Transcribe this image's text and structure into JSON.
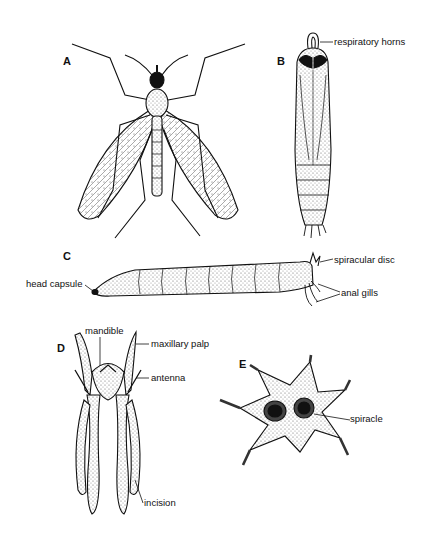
{
  "figure": {
    "panels": [
      {
        "letter": "A",
        "subject": "adult crane fly",
        "labels": []
      },
      {
        "letter": "B",
        "subject": "pupa",
        "labels": [
          "respiratory horns"
        ]
      },
      {
        "letter": "C",
        "subject": "larva",
        "labels": [
          "head capsule",
          "spiracular disc",
          "anal gills"
        ]
      },
      {
        "letter": "D",
        "subject": "larval head capsule",
        "labels": [
          "mandible",
          "maxillary palp",
          "antenna",
          "incision"
        ]
      },
      {
        "letter": "E",
        "subject": "spiracular disc",
        "labels": [
          "spiracle"
        ]
      }
    ]
  },
  "colors": {
    "ink": "#111111",
    "stipple": "#9a9a9a",
    "background": "#ffffff"
  }
}
